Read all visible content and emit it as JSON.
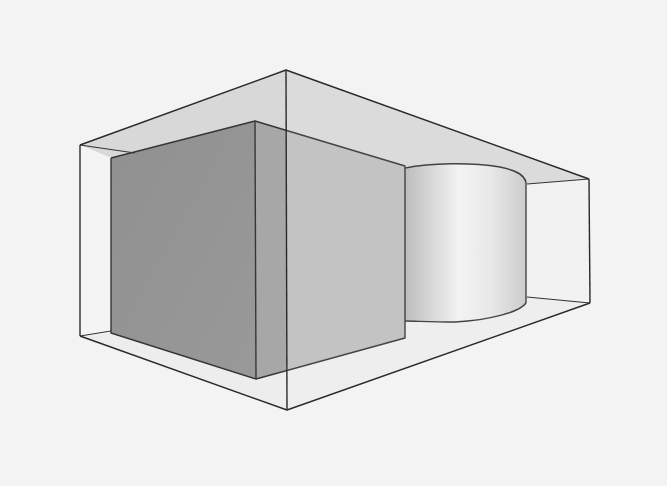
{
  "figure": {
    "description": "Perspective line drawing of a transparent rectangular box enclosing a shaded cube and a cylinder",
    "background_color": "#f3f3f3",
    "objects": [
      {
        "name": "enclosing-box",
        "type": "box",
        "style": "wireframe, translucent faces"
      },
      {
        "name": "cube",
        "type": "cube",
        "style": "shaded gray"
      },
      {
        "name": "cylinder",
        "type": "cylinder",
        "style": "shaded light gray gradient"
      }
    ],
    "colors": {
      "edge": "#2a2a2a",
      "ceiling": "#d6d6d6",
      "floor": "#eeeeee",
      "back_wall": "#f1f1f1",
      "left_wall": "#f4f4f4",
      "cube_front": "#8e8e8e",
      "cube_side_inner": "#a2a2a2",
      "cube_side_outer": "#bbbbbb",
      "cylinder_dark": "#b8b8b8",
      "cylinder_light": "#f2f2f2"
    }
  }
}
